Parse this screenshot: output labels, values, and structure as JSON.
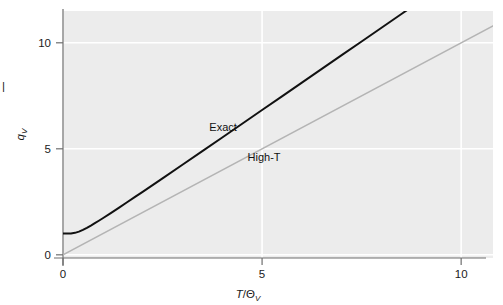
{
  "chart_data": {
    "type": "line",
    "title": "",
    "subtitle": "",
    "xlabel": "T/Θ",
    "xlabel_italic_part": "T",
    "xlabel_sub": "V",
    "ylabel": "q",
    "ylabel_sub": "V",
    "xlim": [
      0,
      10.8
    ],
    "ylim": [
      -0.15,
      11.5
    ],
    "xticks": [
      0,
      5,
      10
    ],
    "xtick_labels": [
      "0",
      "5",
      "10"
    ],
    "yticks": [
      0,
      5,
      10
    ],
    "ytick_labels": [
      "0",
      "5",
      "10"
    ],
    "grid": true,
    "grid_color": "#ffffff",
    "plot_bgcolor": "#ececec",
    "figure_bgcolor": "#ffffff",
    "legend_position": "inline-annotations",
    "annotations": [
      {
        "text": "Exact",
        "x": 4.02,
        "y": 5.85,
        "color": "#111111"
      },
      {
        "text": "High-T",
        "x": 5.05,
        "y": 4.42,
        "color": "#111111"
      }
    ],
    "series": [
      {
        "name": "Exact",
        "label": "Exact",
        "color": "#111111",
        "width": 2.0,
        "x": [
          0,
          0.1,
          0.2,
          0.3,
          0.4,
          0.5,
          0.6,
          0.7,
          0.8,
          0.9,
          1.0,
          1.2,
          1.4,
          1.6,
          1.8,
          2.0,
          2.5,
          3.0,
          3.5,
          4.0,
          4.5,
          5.0,
          5.5,
          6.0,
          6.5,
          7.0,
          7.5,
          8.0,
          8.5,
          9.0,
          9.5,
          10.0,
          10.5,
          10.8
        ],
        "y": [
          1.0,
          1.0,
          1.007,
          1.037,
          1.096,
          1.177,
          1.274,
          1.38,
          1.492,
          1.608,
          1.726,
          1.969,
          2.216,
          2.466,
          2.718,
          2.971,
          3.607,
          4.248,
          4.891,
          5.536,
          6.182,
          6.828,
          7.475,
          8.122,
          8.769,
          9.417,
          10.064,
          10.712,
          11.359,
          12.007,
          12.655,
          13.303,
          13.951,
          14.34
        ]
      },
      {
        "name": "High-T",
        "label": "High-T",
        "color": "#b4b4b4",
        "width": 1.5,
        "x": [
          0,
          10.8
        ],
        "y": [
          0,
          10.8
        ]
      }
    ]
  },
  "axes": {
    "x_axis_name": "x-axis",
    "y_axis_name": "y-axis"
  }
}
